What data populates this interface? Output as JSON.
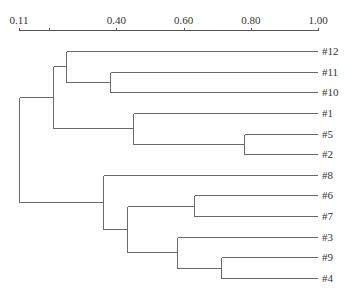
{
  "chart_data": {
    "type": "dendrogram",
    "title": "",
    "xlabel": "",
    "ylabel": "",
    "axis": {
      "position": "top",
      "range": [
        0.11,
        1.0
      ],
      "tick_labels": [
        "0.11",
        "0.40",
        "0.60",
        "0.80",
        "1.00"
      ],
      "tick_values": [
        0.11,
        0.4,
        0.6,
        0.8,
        1.0
      ],
      "minor_ticks": [
        0.2
      ]
    },
    "grid": false,
    "leaves": [
      "#12",
      "#11",
      "#10",
      "#1",
      "#5",
      "#2",
      "#8",
      "#6",
      "#7",
      "#3",
      "#9",
      "#4"
    ],
    "merges": [
      {
        "id": "n1",
        "children": [
          "#11",
          "#10"
        ],
        "height": 0.38
      },
      {
        "id": "n2",
        "children": [
          "#12",
          "n1"
        ],
        "height": 0.25
      },
      {
        "id": "n3",
        "children": [
          "#5",
          "#2"
        ],
        "height": 0.78
      },
      {
        "id": "n4",
        "children": [
          "#1",
          "n3"
        ],
        "height": 0.45
      },
      {
        "id": "n5",
        "children": [
          "n2",
          "n4"
        ],
        "height": 0.21
      },
      {
        "id": "n6",
        "children": [
          "#6",
          "#7"
        ],
        "height": 0.63
      },
      {
        "id": "n7",
        "children": [
          "#9",
          "#4"
        ],
        "height": 0.71
      },
      {
        "id": "n8",
        "children": [
          "#3",
          "n7"
        ],
        "height": 0.58
      },
      {
        "id": "n9",
        "children": [
          "n6",
          "n8"
        ],
        "height": 0.43
      },
      {
        "id": "n10",
        "children": [
          "#8",
          "n9"
        ],
        "height": 0.36
      },
      {
        "id": "root",
        "children": [
          "n5",
          "n10"
        ],
        "height": 0.11
      }
    ]
  }
}
